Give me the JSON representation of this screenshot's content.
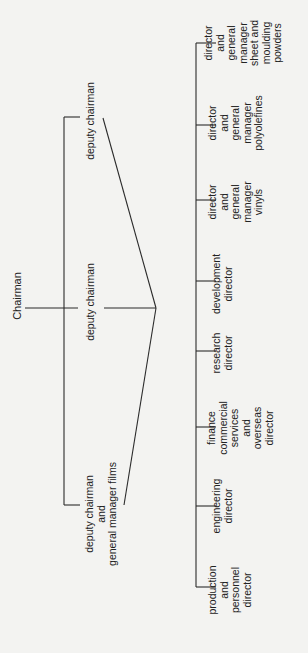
{
  "diagram": {
    "type": "organization-chart",
    "orientation": "rotated-90-ccw",
    "root": {
      "label": "Chairman"
    },
    "deputies": [
      {
        "id": "deputy-top",
        "lines": [
          "deputy chairman"
        ]
      },
      {
        "id": "deputy-middle",
        "lines": [
          "deputy chairman"
        ]
      },
      {
        "id": "deputy-films",
        "lines": [
          "deputy chairman",
          "and",
          "general manager films"
        ]
      }
    ],
    "directors": [
      {
        "id": "production",
        "lines": [
          "production",
          "and",
          "personnel",
          "director"
        ]
      },
      {
        "id": "engineering",
        "lines": [
          "engineering",
          "director"
        ]
      },
      {
        "id": "finance",
        "lines": [
          "finance",
          "commercial",
          "services",
          "and",
          "overseas",
          "director"
        ]
      },
      {
        "id": "research",
        "lines": [
          "research",
          "director"
        ]
      },
      {
        "id": "development",
        "lines": [
          "development",
          "director"
        ]
      },
      {
        "id": "vinyls",
        "lines": [
          "director",
          "and",
          "general",
          "manager",
          "vinyls"
        ]
      },
      {
        "id": "polyolefines",
        "lines": [
          "director",
          "and",
          "general",
          "manager",
          "polyolefines"
        ]
      },
      {
        "id": "sheet",
        "lines": [
          "director",
          "and",
          "general",
          "manager",
          "sheet and",
          "moulding",
          "powders"
        ]
      }
    ],
    "colors": {
      "background": "#f3f3f1",
      "ink": "#2a2a2a"
    }
  }
}
